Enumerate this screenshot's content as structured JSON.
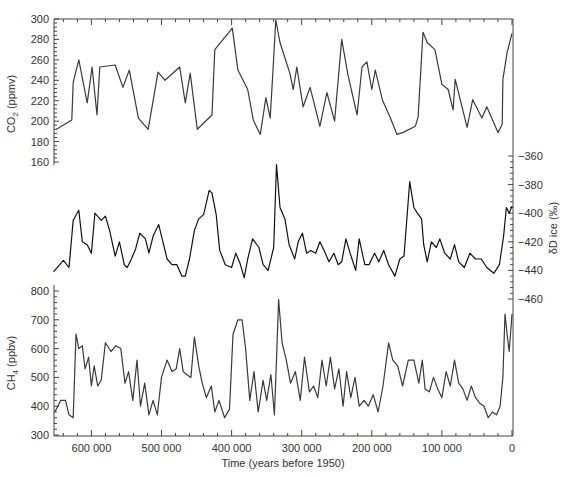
{
  "chart_data": {
    "type": "line",
    "title": "",
    "xlabel": "Time (years before 1950)",
    "xlim": [
      654000,
      0
    ],
    "x_ticks": [
      600000,
      500000,
      400000,
      300000,
      200000,
      100000,
      0
    ],
    "x_tick_labels": [
      "600 000",
      "500 000",
      "400 000",
      "300 000",
      "200 000",
      "100 000",
      "0"
    ],
    "grid": false,
    "panels": [
      {
        "name": "CO2",
        "ylabel": "CO2 (ppmv)",
        "ylabel_main": "CO",
        "ylabel_sub": "2",
        "ylabel_unit": " (ppmv)",
        "y_axis_side": "left",
        "ylim": [
          160,
          300
        ],
        "y_ticks": [
          160,
          180,
          200,
          220,
          240,
          260,
          280,
          300
        ],
        "color": "#3a3a3a",
        "x": [
          650000,
          628000,
          626000,
          618000,
          606000,
          599000,
          592000,
          588000,
          566000,
          555000,
          546000,
          533000,
          519000,
          505000,
          495000,
          474000,
          466000,
          459000,
          449000,
          428000,
          424000,
          399000,
          391000,
          377000,
          369000,
          359000,
          351000,
          345000,
          341000,
          337000,
          331000,
          317000,
          312000,
          307000,
          298000,
          288000,
          274000,
          264000,
          253000,
          243000,
          234000,
          221000,
          214000,
          207000,
          200000,
          195000,
          185000,
          174000,
          164000,
          155000,
          138000,
          134000,
          127000,
          121000,
          110000,
          100000,
          91000,
          84000,
          81000,
          64000,
          56000,
          43000,
          36000,
          20000,
          14000,
          13000,
          7000,
          0
        ],
        "values": [
          192,
          201,
          238,
          260,
          218,
          253,
          206,
          253,
          255,
          233,
          250,
          203,
          192,
          248,
          240,
          253,
          218,
          247,
          192,
          206,
          270,
          291,
          250,
          231,
          201,
          187,
          223,
          203,
          250,
          299,
          277,
          247,
          231,
          253,
          214,
          233,
          195,
          228,
          200,
          280,
          245,
          206,
          253,
          258,
          231,
          250,
          221,
          204,
          187,
          189,
          195,
          204,
          287,
          277,
          270,
          236,
          231,
          211,
          241,
          194,
          221,
          203,
          214,
          189,
          197,
          241,
          267,
          286
        ]
      },
      {
        "name": "deltaD",
        "ylabel": "δD ice (‰)",
        "y_axis_side": "right",
        "ylim": [
          -470,
          -350
        ],
        "y_ticks": [
          -360,
          -380,
          -400,
          -420,
          -440,
          -460
        ],
        "y_tick_labels": [
          "−360",
          "−380",
          "−400",
          "−420",
          "−440",
          "−460"
        ],
        "color": "#111111",
        "x": [
          654000,
          640000,
          632000,
          626000,
          618000,
          613000,
          606000,
          600000,
          595000,
          586000,
          580000,
          574000,
          566000,
          560000,
          553000,
          549000,
          543000,
          537000,
          531000,
          523000,
          518000,
          512000,
          504000,
          498000,
          492000,
          485000,
          478000,
          471000,
          466000,
          460000,
          453000,
          447000,
          440000,
          432000,
          428000,
          422000,
          417000,
          409000,
          400000,
          394000,
          388000,
          382000,
          377000,
          370000,
          361000,
          355000,
          348000,
          340000,
          336000,
          331000,
          324000,
          318000,
          310000,
          305000,
          299000,
          293000,
          287000,
          280000,
          274000,
          268000,
          261000,
          254000,
          248000,
          243000,
          237000,
          231000,
          223000,
          218000,
          210000,
          204000,
          196000,
          190000,
          183000,
          176000,
          167000,
          160000,
          154000,
          146000,
          140000,
          135000,
          129000,
          126000,
          121000,
          115000,
          108000,
          103000,
          96000,
          88000,
          82000,
          76000,
          68000,
          60000,
          52000,
          44000,
          36000,
          26000,
          18000,
          12000,
          8000,
          4000,
          0
        ],
        "values": [
          -441,
          -433,
          -438,
          -405,
          -398,
          -420,
          -422,
          -428,
          -400,
          -405,
          -402,
          -412,
          -430,
          -420,
          -436,
          -438,
          -432,
          -425,
          -414,
          -418,
          -428,
          -416,
          -408,
          -420,
          -432,
          -436,
          -436,
          -444,
          -444,
          -432,
          -412,
          -404,
          -401,
          -384,
          -386,
          -401,
          -426,
          -436,
          -438,
          -428,
          -435,
          -445,
          -432,
          -418,
          -424,
          -436,
          -440,
          -424,
          -366,
          -396,
          -404,
          -422,
          -432,
          -420,
          -414,
          -428,
          -426,
          -428,
          -420,
          -426,
          -434,
          -428,
          -436,
          -434,
          -418,
          -428,
          -440,
          -418,
          -436,
          -436,
          -428,
          -434,
          -426,
          -436,
          -444,
          -432,
          -430,
          -378,
          -396,
          -400,
          -404,
          -422,
          -434,
          -420,
          -424,
          -418,
          -428,
          -432,
          -422,
          -434,
          -438,
          -428,
          -432,
          -432,
          -438,
          -442,
          -436,
          -416,
          -396,
          -400,
          -395
        ]
      },
      {
        "name": "CH4",
        "ylabel": "CH4 (ppbv)",
        "ylabel_main": "CH",
        "ylabel_sub": "4",
        "ylabel_unit": " (ppbv)",
        "y_axis_side": "left",
        "ylim": [
          300,
          800
        ],
        "y_ticks": [
          300,
          400,
          500,
          600,
          700,
          800
        ],
        "color": "#3a3a3a",
        "x": [
          652000,
          644000,
          637000,
          632000,
          626000,
          622000,
          618000,
          613000,
          609000,
          604000,
          600000,
          596000,
          591000,
          586000,
          580000,
          572000,
          565000,
          558000,
          552000,
          547000,
          541000,
          535000,
          530000,
          524000,
          518000,
          512000,
          506000,
          500000,
          492000,
          485000,
          479000,
          474000,
          469000,
          464000,
          458000,
          453000,
          447000,
          442000,
          436000,
          429000,
          424000,
          418000,
          410000,
          403000,
          398000,
          391000,
          385000,
          380000,
          374000,
          368000,
          362000,
          355000,
          350000,
          344000,
          339000,
          336000,
          333000,
          328000,
          322000,
          316000,
          309000,
          302000,
          296000,
          289000,
          283000,
          277000,
          271000,
          265000,
          259000,
          253000,
          247000,
          241000,
          236000,
          230000,
          224000,
          218000,
          211000,
          205000,
          198000,
          191000,
          184000,
          176000,
          170000,
          163000,
          156000,
          148000,
          140000,
          133000,
          128000,
          124000,
          118000,
          112000,
          106000,
          100000,
          94000,
          88000,
          82000,
          76000,
          70000,
          64000,
          58000,
          52000,
          46000,
          40000,
          34000,
          28000,
          22000,
          17000,
          13000,
          10000,
          7000,
          4000,
          0
        ],
        "values": [
          380,
          420,
          420,
          370,
          360,
          650,
          600,
          610,
          530,
          570,
          470,
          540,
          470,
          490,
          620,
          590,
          610,
          600,
          480,
          520,
          420,
          560,
          400,
          480,
          370,
          420,
          370,
          500,
          560,
          520,
          530,
          600,
          520,
          510,
          500,
          640,
          540,
          480,
          430,
          470,
          380,
          420,
          360,
          390,
          650,
          700,
          700,
          600,
          420,
          520,
          380,
          490,
          420,
          510,
          370,
          560,
          770,
          620,
          560,
          480,
          520,
          420,
          570,
          450,
          470,
          430,
          560,
          470,
          570,
          460,
          530,
          400,
          520,
          430,
          500,
          400,
          420,
          400,
          440,
          380,
          470,
          620,
          560,
          540,
          470,
          560,
          560,
          480,
          560,
          460,
          450,
          500,
          460,
          430,
          520,
          470,
          560,
          480,
          460,
          420,
          470,
          430,
          410,
          400,
          360,
          380,
          370,
          400,
          500,
          720,
          650,
          590,
          720
        ]
      }
    ]
  }
}
